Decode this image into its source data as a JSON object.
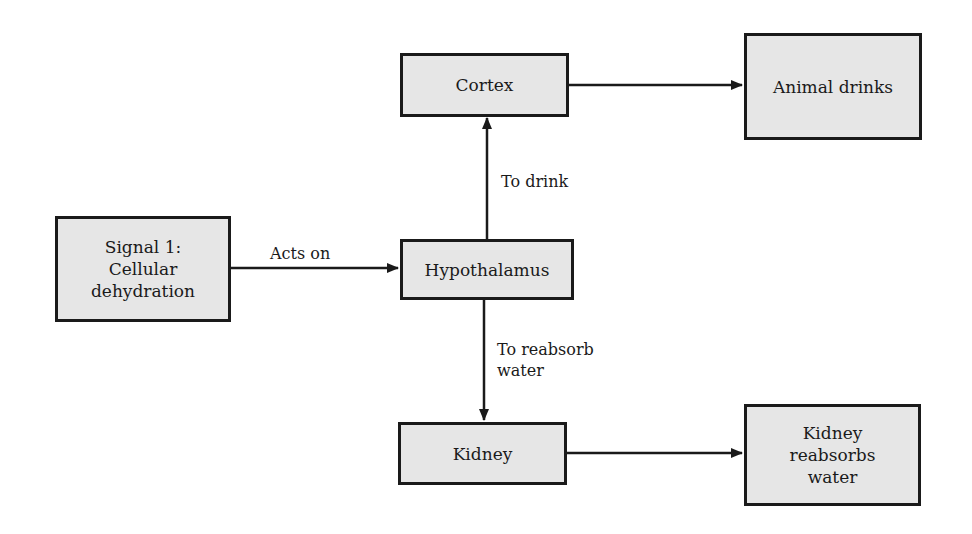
{
  "diagram": {
    "nodes": {
      "signal": {
        "line1": "Signal 1:",
        "line2": "Cellular",
        "line3": "dehydration"
      },
      "hypothalamus": {
        "label": "Hypothalamus"
      },
      "cortex": {
        "label": "Cortex"
      },
      "animal_drinks": {
        "label": "Animal drinks"
      },
      "kidney": {
        "label": "Kidney"
      },
      "kidney_reabsorbs": {
        "line1": "Kidney",
        "line2": "reabsorbs",
        "line3": "water"
      }
    },
    "edges": {
      "acts_on": {
        "label": "Acts on",
        "from": "signal",
        "to": "hypothalamus"
      },
      "to_drink": {
        "label": "To drink",
        "from": "hypothalamus",
        "to": "cortex"
      },
      "to_reabsorb": {
        "line1": "To reabsorb",
        "line2": "water",
        "from": "hypothalamus",
        "to": "kidney"
      },
      "cortex_to_drinks": {
        "label": "",
        "from": "cortex",
        "to": "animal_drinks"
      },
      "kidney_to_reabsorbs": {
        "label": "",
        "from": "kidney",
        "to": "kidney_reabsorbs"
      }
    },
    "colors": {
      "box_fill": "#e6e6e6",
      "stroke": "#1a1a1a"
    }
  }
}
